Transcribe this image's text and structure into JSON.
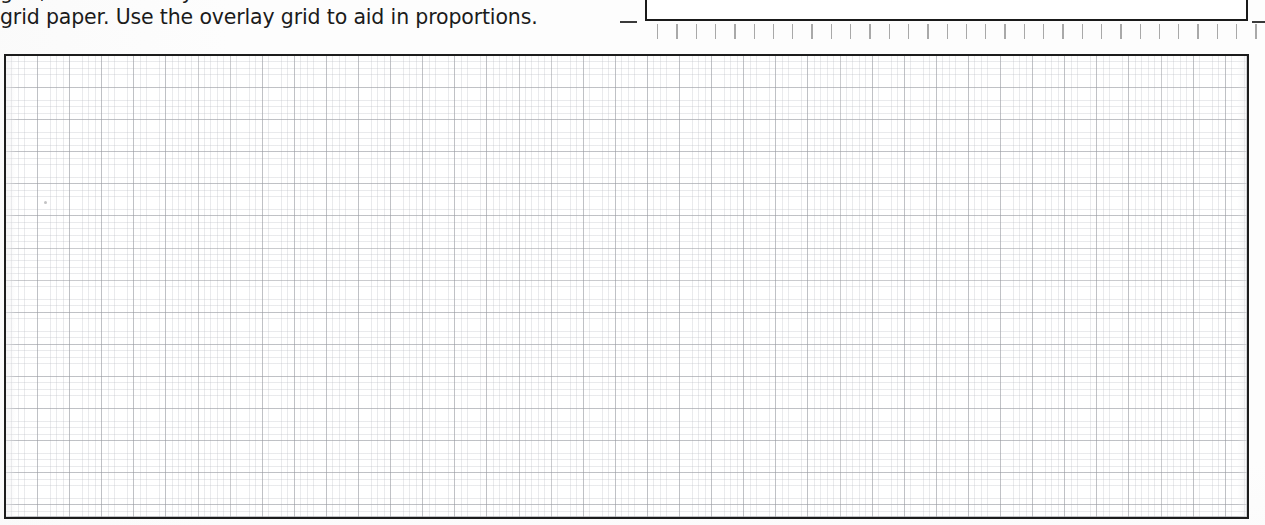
{
  "page": {
    "width": 1265,
    "height": 525,
    "background_color": "#ffffff",
    "document_type": "worksheet-scan"
  },
  "instructions": {
    "line_clipped": "grid, but draw it by the same method as the",
    "line_visible": "grid paper. Use the overlay grid to aid in proportions."
  },
  "header_box": {
    "content": "",
    "border_color": "#1a1a1a"
  },
  "tick_ruler": {
    "tick_count": 32,
    "spacing_px": 19.3,
    "tick_color": "#a9a9a9",
    "start_x": 12
  },
  "grid_box": {
    "content": "",
    "border_color": "#1c1c1c",
    "minor_spacing_px": 6.42,
    "major_spacing_px": 32.1,
    "minor_line_color": "#b7bac1",
    "major_line_color": "#96989e",
    "fill_color": "#ffffff"
  },
  "connectors": {
    "left_dash": "",
    "right_dash": ""
  }
}
